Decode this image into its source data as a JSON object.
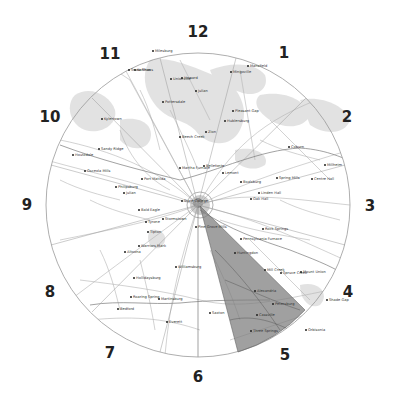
{
  "map": {
    "center": {
      "x": 198,
      "y": 205
    },
    "radius": 152,
    "wedge_color": "#8a8a8a",
    "circle_color": "#9a9a9a",
    "forest_color": "#dcdcdc",
    "road_color": "#b8b8b8"
  },
  "clock_labels": [
    {
      "text": "12",
      "x": 198,
      "y": 32
    },
    {
      "text": "1",
      "x": 284,
      "y": 53
    },
    {
      "text": "2",
      "x": 347,
      "y": 117
    },
    {
      "text": "3",
      "x": 370,
      "y": 206
    },
    {
      "text": "4",
      "x": 348,
      "y": 292
    },
    {
      "text": "5",
      "x": 285,
      "y": 355
    },
    {
      "text": "6",
      "x": 198,
      "y": 377
    },
    {
      "text": "7",
      "x": 110,
      "y": 353
    },
    {
      "text": "8",
      "x": 50,
      "y": 292
    },
    {
      "text": "9",
      "x": 27,
      "y": 205
    },
    {
      "text": "10",
      "x": 50,
      "y": 117
    },
    {
      "text": "11",
      "x": 110,
      "y": 54
    }
  ],
  "towns": [
    {
      "name": "Snow Shoe",
      "x": 128,
      "y": 69
    },
    {
      "name": "Milesburg",
      "x": 152,
      "y": 50
    },
    {
      "name": "Unionville",
      "x": 170,
      "y": 78
    },
    {
      "name": "Julian",
      "x": 195,
      "y": 90
    },
    {
      "name": "Mansfield",
      "x": 247,
      "y": 65
    },
    {
      "name": "Mingoville",
      "x": 230,
      "y": 71
    },
    {
      "name": "Hublersburg",
      "x": 224,
      "y": 120
    },
    {
      "name": "Howard",
      "x": 181,
      "y": 77
    },
    {
      "name": "Pleasant Gap",
      "x": 232,
      "y": 110
    },
    {
      "name": "Zion",
      "x": 205,
      "y": 131
    },
    {
      "name": "Coburn",
      "x": 288,
      "y": 146
    },
    {
      "name": "Millheim",
      "x": 324,
      "y": 164
    },
    {
      "name": "Centre Hall",
      "x": 311,
      "y": 178
    },
    {
      "name": "Spring Mills",
      "x": 276,
      "y": 177
    },
    {
      "name": "Boalsburg",
      "x": 240,
      "y": 181
    },
    {
      "name": "Lemont",
      "x": 222,
      "y": 172
    },
    {
      "name": "Linden Hall",
      "x": 258,
      "y": 192
    },
    {
      "name": "Oak Hall",
      "x": 250,
      "y": 198
    },
    {
      "name": "Pine Grove Mills",
      "x": 195,
      "y": 226
    },
    {
      "name": "Rock Springs",
      "x": 262,
      "y": 228
    },
    {
      "name": "Pennsylvania Furnace",
      "x": 240,
      "y": 238
    },
    {
      "name": "Spruce Creek",
      "x": 280,
      "y": 272
    },
    {
      "name": "Alexandria",
      "x": 254,
      "y": 290
    },
    {
      "name": "Petersburg",
      "x": 272,
      "y": 303
    },
    {
      "name": "Warriors Mark",
      "x": 138,
      "y": 245
    },
    {
      "name": "Port Matilda",
      "x": 141,
      "y": 178
    },
    {
      "name": "Julian",
      "x": 123,
      "y": 192
    },
    {
      "name": "Stormstown",
      "x": 162,
      "y": 218
    },
    {
      "name": "State College",
      "x": 181,
      "y": 200
    },
    {
      "name": "Bellefonte",
      "x": 203,
      "y": 165
    },
    {
      "name": "Tyrone",
      "x": 145,
      "y": 221
    },
    {
      "name": "Bald Eagle",
      "x": 138,
      "y": 209
    },
    {
      "name": "Philipsburg",
      "x": 115,
      "y": 186
    },
    {
      "name": "Osceola Mills",
      "x": 84,
      "y": 170
    },
    {
      "name": "Houtzdale",
      "x": 72,
      "y": 154
    },
    {
      "name": "Sandy Ridge",
      "x": 98,
      "y": 148
    },
    {
      "name": "Kylertown",
      "x": 101,
      "y": 118
    },
    {
      "name": "Karthaus",
      "x": 134,
      "y": 69
    },
    {
      "name": "Pottersdale",
      "x": 162,
      "y": 101
    },
    {
      "name": "Beech Creek",
      "x": 179,
      "y": 136
    },
    {
      "name": "Martha Furnace",
      "x": 179,
      "y": 167
    },
    {
      "name": "Tipton",
      "x": 147,
      "y": 231
    },
    {
      "name": "Altoona",
      "x": 124,
      "y": 251
    },
    {
      "name": "Hollidaysburg",
      "x": 133,
      "y": 277
    },
    {
      "name": "Williamsburg",
      "x": 175,
      "y": 266
    },
    {
      "name": "Huntingdon",
      "x": 234,
      "y": 252
    },
    {
      "name": "Mill Creek",
      "x": 264,
      "y": 269
    },
    {
      "name": "Mount Union",
      "x": 300,
      "y": 271
    },
    {
      "name": "Shade Gap",
      "x": 326,
      "y": 299
    },
    {
      "name": "Orbisonia",
      "x": 305,
      "y": 329
    },
    {
      "name": "Roaring Spring",
      "x": 130,
      "y": 296
    },
    {
      "name": "Martinsburg",
      "x": 158,
      "y": 298
    },
    {
      "name": "Bedford",
      "x": 117,
      "y": 308
    },
    {
      "name": "Everett",
      "x": 166,
      "y": 321
    },
    {
      "name": "Saxton",
      "x": 209,
      "y": 312
    },
    {
      "name": "Three Springs",
      "x": 250,
      "y": 330
    },
    {
      "name": "Cassville",
      "x": 256,
      "y": 314
    }
  ]
}
